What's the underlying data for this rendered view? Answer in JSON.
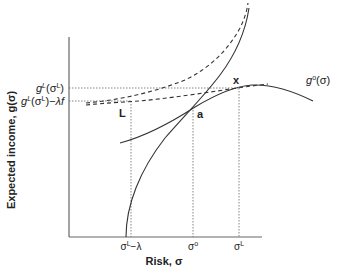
{
  "diagram": {
    "title": "",
    "axes": {
      "x_label": "Risk, σ",
      "y_label": "Expected income, g(σ)"
    },
    "x_ticks": [
      {
        "label": "σL−λ",
        "base": "σ",
        "sup": "L",
        "suffix": "−λ"
      },
      {
        "label": "σo",
        "base": "σ",
        "sup": "o",
        "suffix": ""
      },
      {
        "label": "σL",
        "base": "σ",
        "sup": "L",
        "suffix": ""
      }
    ],
    "y_ticks": [
      {
        "label": "gL(σL)",
        "g": "g",
        "gsup": "L",
        "arg": "(σ",
        "argsup": "L",
        "close": ")",
        "suffix": ""
      },
      {
        "label": "gL(σL)−λf",
        "g": "g",
        "gsup": "L",
        "arg": "(σ",
        "argsup": "L",
        "close": ")",
        "suffix": "−λf"
      }
    ],
    "points": [
      {
        "name": "L",
        "label": "L"
      },
      {
        "name": "a",
        "label": "a"
      },
      {
        "name": "x",
        "label": "x"
      }
    ],
    "curves": {
      "go_label": {
        "g": "g",
        "sup": "o",
        "arg": "(σ)"
      }
    },
    "colors": {
      "axis": "#555555",
      "curve": "#333333",
      "dotted": "#777777"
    }
  }
}
